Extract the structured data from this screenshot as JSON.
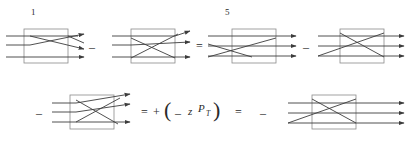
{
  "figure": {
    "kind": "feynman-diagram-equation",
    "background_color": "#ffffff",
    "line_color": "#3c3c3c",
    "box_color": "#787878",
    "text_color": "#2a2a2a"
  },
  "labels": {
    "index_1": "1",
    "index_5": "5",
    "minus": "–",
    "equals": "=",
    "plus": "+",
    "paren_open": "(",
    "paren_close": ")",
    "minus_inner": "–",
    "var_z": "z",
    "var_P": "P",
    "sub_T": "T"
  },
  "rows": [
    {
      "name": "top-row",
      "terms": [
        {
          "name": "diagram-1",
          "label": "1",
          "box": true,
          "arrows": 3
        },
        {
          "name": "operator-minus-1",
          "label": "–"
        },
        {
          "name": "diagram-2",
          "label": "",
          "box": true,
          "arrows": 3
        },
        {
          "name": "operator-equals-1",
          "label": "="
        },
        {
          "name": "diagram-3",
          "label": "5",
          "box": true,
          "arrows": 3
        },
        {
          "name": "operator-minus-2",
          "label": "–"
        },
        {
          "name": "diagram-4",
          "label": "",
          "box": true,
          "arrows": 3
        }
      ]
    },
    {
      "name": "bottom-row",
      "terms": [
        {
          "name": "operator-minus-3",
          "label": "–"
        },
        {
          "name": "diagram-5",
          "label": "",
          "box": true,
          "arrows": 3
        },
        {
          "name": "operator-equals-2",
          "label": "="
        },
        {
          "name": "operator-plus-1",
          "label": "+"
        },
        {
          "name": "expression-zPT",
          "label": "( – z P_T )"
        },
        {
          "name": "operator-equals-3",
          "label": "="
        },
        {
          "name": "operator-minus-4",
          "label": "–"
        },
        {
          "name": "diagram-6",
          "label": "",
          "box": true,
          "arrows": 3
        }
      ]
    }
  ]
}
